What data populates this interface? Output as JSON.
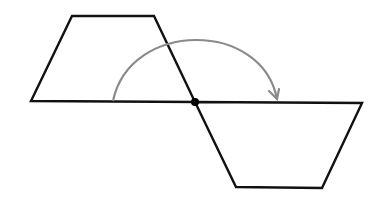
{
  "diagram": {
    "type": "rotation-of-trapezoid",
    "background": "#ffffff",
    "stroke_color": "#111111",
    "arc_color": "#8a8a8a",
    "original_trapezoid": {
      "points": [
        [
          31,
          101
        ],
        [
          72,
          16
        ],
        [
          154,
          16
        ],
        [
          195,
          102
        ]
      ]
    },
    "rotated_trapezoid": {
      "points": [
        [
          195,
          102
        ],
        [
          362,
          103
        ],
        [
          322,
          188
        ],
        [
          236,
          187
        ]
      ]
    },
    "center_point": {
      "x": 195,
      "y": 102,
      "r": 4
    },
    "rotation_arc": {
      "start": [
        113,
        101
      ],
      "control1": [
        130,
        20
      ],
      "control2": [
        262,
        20
      ],
      "end": [
        277,
        99
      ],
      "direction": "clockwise",
      "angle_degrees": 180
    }
  }
}
